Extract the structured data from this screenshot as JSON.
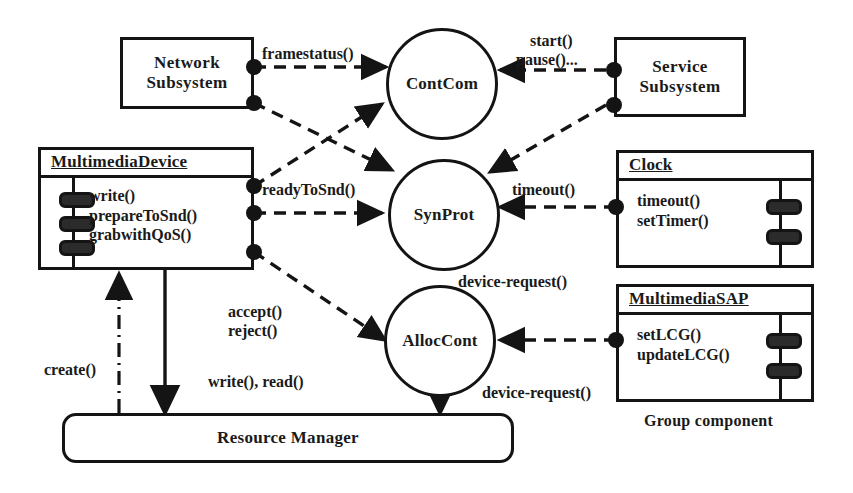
{
  "diagram": {
    "caption": "Group component",
    "stroke_color": "#141414",
    "background": "#ffffff"
  },
  "components": {
    "network_subsystem": {
      "name": "network-subsystem",
      "line1": "Network",
      "line2": "Subsystem"
    },
    "service_subsystem": {
      "name": "service-subsystem",
      "line1": "Service",
      "line2": "Subsystem"
    },
    "multimedia_device": {
      "title": "MultimediaDevice",
      "operations": [
        "write()",
        "prepareToSnd()",
        "grabwithQoS()"
      ]
    },
    "clock": {
      "title": "Clock",
      "operations": [
        "timeout()",
        "setTimer()"
      ]
    },
    "multimedia_sap": {
      "title": "MultimediaSAP",
      "operations": [
        "setLCG()",
        "updateLCG()"
      ]
    },
    "resource_manager": {
      "label": "Resource Manager"
    }
  },
  "interfaces": {
    "contcom": {
      "label": "ContCom"
    },
    "synprot": {
      "label": "SynProt"
    },
    "alloccont": {
      "label": "AllocCont"
    }
  },
  "messages": {
    "framestatus": "framestatus()",
    "start": "start()",
    "pause": "pause()...",
    "ready_to_snd": "readyToSnd()",
    "timeout": "timeout()",
    "device_request_top": "device-request()",
    "device_request_bottom": "device-request()",
    "accept": "accept()",
    "reject": "reject()",
    "write_read": "write(), read()",
    "create": "create()"
  }
}
